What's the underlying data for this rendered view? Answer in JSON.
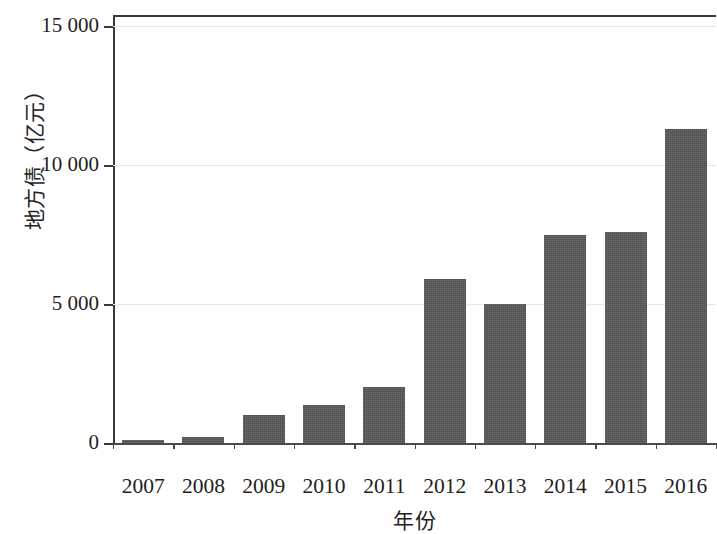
{
  "chart_data": {
    "type": "bar",
    "title": "",
    "subtitle": "",
    "xlabel": "年份",
    "ylabel": "地方债（亿元）",
    "categories": [
      "2007",
      "2008",
      "2009",
      "2010",
      "2011",
      "2012",
      "2013",
      "2014",
      "2015",
      "2016"
    ],
    "values": [
      120,
      200,
      1000,
      1350,
      2000,
      5900,
      5000,
      7500,
      7600,
      11300
    ],
    "series": [
      {
        "name": "地方债",
        "values": [
          120,
          200,
          1000,
          1350,
          2000,
          5900,
          5000,
          7500,
          7600,
          11300
        ]
      }
    ],
    "ylim": [
      0,
      15000
    ],
    "y_ticks": [
      0,
      5000,
      10000,
      15000
    ],
    "y_tick_labels": [
      "0",
      "5 000",
      "10 000",
      "15 000"
    ],
    "x_tick_labels": [
      "2007",
      "2008",
      "2009",
      "2010",
      "2011",
      "2012",
      "2013",
      "2014",
      "2015",
      "2016"
    ],
    "grid": true,
    "grid_axis": "y",
    "legend": false,
    "legend_position": "none",
    "bar_color": "#585858",
    "grid_color": "#e6e6e6",
    "axis_color": "#3a3a3a",
    "annotations": []
  }
}
